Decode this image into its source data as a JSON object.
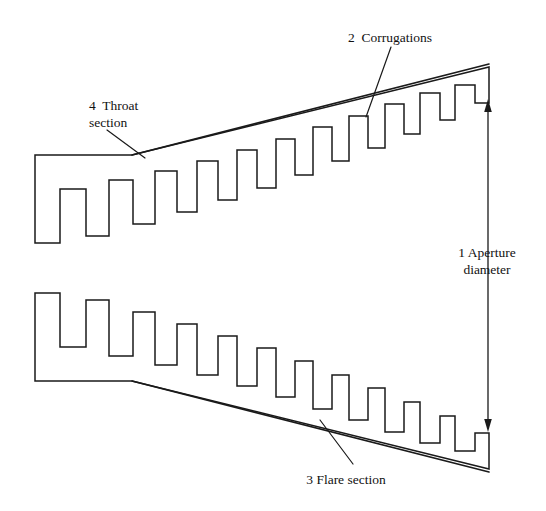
{
  "figure": {
    "background_color": "#ffffff",
    "line_color": "#1a1a1a",
    "width": 546,
    "height": 511
  },
  "labels": {
    "aperture": {
      "line1": "1 Aperture",
      "line2": "diameter",
      "number": "1",
      "name": "Aperture diameter"
    },
    "corrugations": {
      "text": "2  Corrugations",
      "number": "2",
      "name": "Corrugations"
    },
    "flare": {
      "text": "3 Flare section",
      "number": "3",
      "name": "Flare section"
    },
    "throat": {
      "line1": "4  Throat",
      "line2": "section",
      "number": "4",
      "name": "Throat section"
    }
  },
  "geometry": {
    "upper_horn_path": "M 35,243 L 35,155 L 132,155 L 196,128 L 268,101 L 340,75 L 412,67 L 489,67 L 489,103 L 475,103 L 475,85 L 455,85 L 455,120 L 440,120 L 440,93 L 420,93 L 420,134 L 404,134 L 404,104 L 385,104 L 385,148 L 368,148 L 368,116 L 349,116 L 349,161 L 332,161 L 332,127 L 313,127 L 313,175 L 295,175 L 295,139 L 276,139 L 276,188 L 257,188 L 257,150 L 237,150 L 237,200 L 218,200 L 218,161 L 197,161 L 197,212 L 177,212 L 177,171 L 155,171 L 155,224 L 133,224 L 133,180 L 109,180 L 109,236 L 86,236 L 86,189 L 60,189 L 60,243 Z",
    "lower_horn_path": "M 35,381 L 35,293 L 60,293 L 60,347 L 86,347 L 86,300 L 109,300 L 109,356 L 133,356 L 133,312 L 155,312 L 155,365 L 177,365 L 177,324 L 197,324 L 197,375 L 218,375 L 218,336 L 237,336 L 237,386 L 257,386 L 257,348 L 276,348 L 276,397 L 295,397 L 295,361 L 313,361 L 313,409 L 332,409 L 332,375 L 349,375 L 349,420 L 368,420 L 368,388 L 385,388 L 385,432 L 404,432 L 404,402 L 420,402 L 420,443 L 440,443 L 440,416 L 455,416 L 455,451 L 475,451 L 475,433 L 489,433 L 489,469 L 412,469 L 340,461 L 268,435 L 196,408 L 132,381 Z",
    "upper_flare_line": {
      "x1": 132,
      "y1": 155,
      "x2": 460,
      "y2": 63
    },
    "lower_flare_line": {
      "x1": 132,
      "y1": 381,
      "x2": 460,
      "y2": 473
    },
    "throat_leader": {
      "x1": 108,
      "y1": 131,
      "x2": 144,
      "y2": 157
    },
    "corrugations_leader": {
      "x1": 390,
      "y1": 48,
      "x2": 367,
      "y2": 116
    },
    "flare_leader": {
      "x1": 352,
      "y1": 463,
      "x2": 321,
      "y2": 421
    },
    "dimension_arrow": {
      "x": 488,
      "y_top": 101,
      "y_bottom": 430
    }
  }
}
